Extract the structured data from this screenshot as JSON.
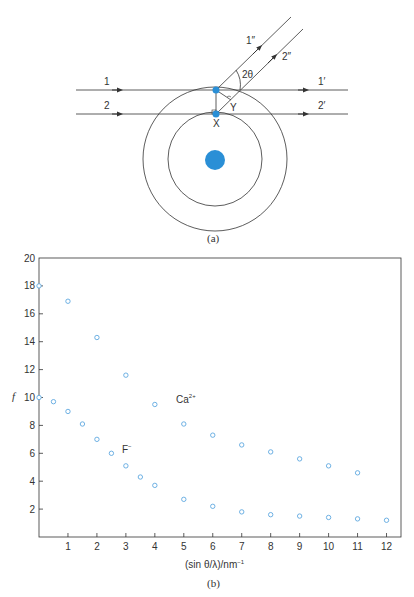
{
  "diagram_a": {
    "caption": "(a)",
    "beam_labels": {
      "in1": "1",
      "in2": "2",
      "out1": "1′",
      "out2": "2′",
      "scat1": "1″",
      "scat2": "2″"
    },
    "angle_label": "2θ",
    "point_labels": {
      "x": "X",
      "y": "Y"
    },
    "colors": {
      "atom": "#2a8fd6",
      "lines": "#333333"
    }
  },
  "chart_b": {
    "caption": "(b)",
    "ylabel": "f",
    "xlabel": "(sin θ/λ)/nm⁻¹",
    "xlabel_parts": {
      "main": "(sin θ/λ)/nm",
      "sup": "−1"
    },
    "series_labels": {
      "ca": {
        "base": "Ca",
        "sup": "2+"
      },
      "f": {
        "base": "F",
        "sup": "−"
      }
    },
    "marker_color": "#5fa8e0"
  },
  "chart_data": {
    "type": "scatter",
    "title": "",
    "xlabel": "(sin θ/λ)/nm⁻¹",
    "ylabel": "f",
    "xlim": [
      0,
      12.5
    ],
    "ylim": [
      0,
      20
    ],
    "xticks": [
      1,
      2,
      3,
      4,
      5,
      6,
      7,
      8,
      9,
      10,
      11,
      12
    ],
    "yticks": [
      2,
      4,
      6,
      8,
      10,
      12,
      14,
      16,
      18,
      20
    ],
    "grid": false,
    "legend": "inline labels",
    "series": [
      {
        "name": "Ca2+",
        "x": [
          0,
          1,
          2,
          3,
          4,
          5,
          6,
          7,
          8,
          9,
          10,
          11
        ],
        "y": [
          18.0,
          16.9,
          14.3,
          11.6,
          9.5,
          8.1,
          7.3,
          6.6,
          6.1,
          5.6,
          5.1,
          4.6
        ]
      },
      {
        "name": "F-",
        "x": [
          0,
          0.5,
          1,
          1.5,
          2,
          2.5,
          3,
          3.5,
          4,
          5,
          6,
          7,
          8,
          9,
          10,
          11,
          12
        ],
        "y": [
          10.0,
          9.7,
          9.0,
          8.1,
          7.0,
          6.0,
          5.1,
          4.3,
          3.7,
          2.7,
          2.2,
          1.8,
          1.6,
          1.5,
          1.4,
          1.3,
          1.2
        ]
      }
    ]
  }
}
